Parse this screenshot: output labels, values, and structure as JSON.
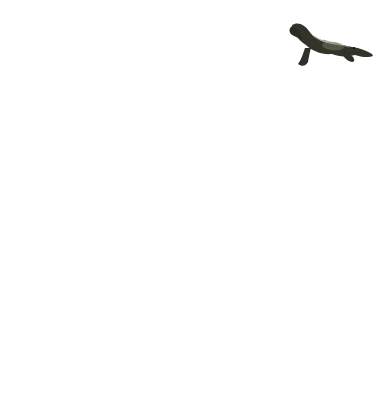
{
  "figure": {
    "type": "cladogram",
    "root_label": "Ancestral chordate",
    "illustration": "crocodile-photo",
    "highlighted_taxon": "Reptilia",
    "colors": {
      "background": "#ffffff",
      "branch_line": "#adadad",
      "highlight_blob": "#e9e9e5",
      "label_text": "#1b1b1b"
    },
    "taxa": [
      {
        "name": "Myxini",
        "x": 23,
        "highlighted": false
      },
      {
        "name": "Cephalaspidomorphi",
        "x": 57,
        "highlighted": false
      },
      {
        "name": "Chondrichthyes",
        "x": 94,
        "highlighted": false
      },
      {
        "name": "Actinopterygii",
        "x": 133,
        "highlighted": false
      },
      {
        "name": "Actinistia",
        "x": 175,
        "highlighted": false
      },
      {
        "name": "Dipnoi",
        "x": 218,
        "highlighted": false
      },
      {
        "name": "Amphibia",
        "x": 255,
        "highlighted": false
      },
      {
        "name": "Mammalia",
        "x": 297,
        "highlighted": false
      },
      {
        "name": "Reptilia",
        "x": 340,
        "highlighted": true
      }
    ],
    "topology_newick": "(Myxini,(Cephalaspidomorphi,(Chondrichthyes,(Actinopterygii,(Actinistia,(Dipnoi,(Amphibia,(Mammalia,Reptilia))))))))Ancestral_chordate",
    "geometry": {
      "leaf_top_y": 83,
      "corner_radius": 8,
      "stroke_width": 4.2,
      "label_dx": 12,
      "label_top_y": 93,
      "junctions": [
        {
          "y": 155,
          "stem_x": 318
        },
        {
          "y": 185,
          "stem_x": 293
        },
        {
          "y": 213,
          "stem_x": 263
        },
        {
          "y": 243,
          "stem_x": 253
        },
        {
          "y": 276,
          "stem_x": 245
        },
        {
          "y": 307,
          "stem_x": 226
        },
        {
          "y": 337,
          "stem_x": 199
        },
        {
          "y": 370,
          "stem_x": 178
        }
      ],
      "root": {
        "stem_x": 178,
        "bottom_y": 387,
        "label_x": 180,
        "label_y": 401
      },
      "highlight_blob": {
        "cx": 343,
        "cy": 117,
        "rx": 23,
        "ry": 41,
        "rotate": 9
      }
    }
  },
  "chart_data": {
    "type": "tree",
    "title": "",
    "leaves_left_to_right": [
      "Myxini",
      "Cephalaspidomorphi",
      "Chondrichthyes",
      "Actinopterygii",
      "Actinistia",
      "Dipnoi",
      "Amphibia",
      "Mammalia",
      "Reptilia"
    ],
    "root": "Ancestral chordate",
    "highlighted_leaf": "Reptilia",
    "branching_order_from_root": [
      "Myxini",
      "Cephalaspidomorphi",
      "Chondrichthyes",
      "Actinopterygii",
      "Actinistia",
      "Dipnoi",
      "Amphibia",
      "Mammalia + Reptilia"
    ]
  }
}
